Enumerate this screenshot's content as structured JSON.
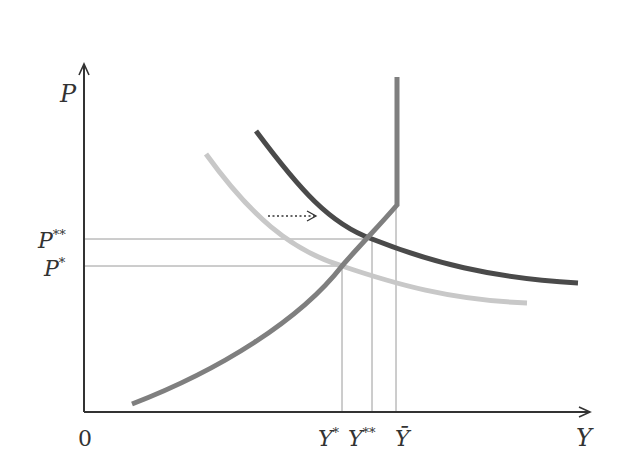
{
  "axes": {
    "y_label": "P",
    "x_label": "Y",
    "origin_label": "0",
    "y_ticks": [
      {
        "label_base": "P",
        "label_sup": "**",
        "y": 239
      },
      {
        "label_base": "P",
        "label_sup": "*",
        "y": 266
      }
    ],
    "x_ticks": [
      {
        "label_base": "Y",
        "label_sup": "*",
        "x": 342
      },
      {
        "label_base": "Y",
        "label_sup": "**",
        "x": 372
      },
      {
        "label_base": "Ȳ",
        "label_sup": "",
        "x": 396
      }
    ]
  },
  "curves": {
    "aggregate_supply": {
      "color": "#7f7f7f",
      "name": "AS"
    },
    "demand_initial": {
      "color": "#c8c8c8",
      "name": "AD1"
    },
    "demand_shifted": {
      "color": "#4a4a4a",
      "name": "AD2"
    }
  },
  "annotation": {
    "type": "dotted-arrow",
    "direction": "right",
    "meaning": "demand shift"
  },
  "colors": {
    "axis": "#333333",
    "guide_lines": "#9a9a9a"
  }
}
